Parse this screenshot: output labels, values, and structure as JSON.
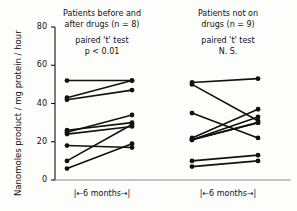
{
  "figure": {
    "background_color": "#fdfdfb",
    "ink_color": "#111111"
  },
  "axis": {
    "y_title": "Nanomoles product / mg protein / hour",
    "y_ticks": [
      "0",
      "20",
      "40",
      "60",
      "80"
    ],
    "y_tick_values": [
      0,
      20,
      40,
      60,
      80
    ],
    "y_min": 0,
    "y_max": 80
  },
  "groups": {
    "left": {
      "heading": "Patients before and\nafter drugs (n = 8)",
      "stat_line1": "paired 't' test",
      "stat_line2": "p  <  0.01",
      "span_label": "|←6 months→|"
    },
    "right": {
      "heading": "Patients not on\ndrugs (n = 9)",
      "stat_line1": "paired 't' test",
      "stat_line2": "N. S.",
      "span_label": "|←6 months→|"
    }
  },
  "chart_data": {
    "type": "line",
    "title": "",
    "xlabel": "",
    "ylabel": "Nanomoles product / mg protein / hour",
    "ylim": [
      0,
      80
    ],
    "yticks": [
      0,
      20,
      40,
      60,
      80
    ],
    "grid": false,
    "legend": "none",
    "x_categories": [
      "before",
      "after"
    ],
    "annotations": [
      "Patients before and after drugs (n = 8)",
      "paired 't' test p < 0.01",
      "Patients not on drugs (n = 9)",
      "paired 't' test N. S.",
      "|<-6 months->|"
    ],
    "series": [
      {
        "name": "left-1",
        "group": "left",
        "values": [
          52,
          52
        ]
      },
      {
        "name": "left-2",
        "group": "left",
        "values": [
          43,
          52
        ]
      },
      {
        "name": "left-3",
        "group": "left",
        "values": [
          42,
          47
        ]
      },
      {
        "name": "left-4",
        "group": "left",
        "values": [
          26,
          30
        ]
      },
      {
        "name": "left-5",
        "group": "left",
        "values": [
          25,
          34
        ]
      },
      {
        "name": "left-6",
        "group": "left",
        "values": [
          24,
          28
        ]
      },
      {
        "name": "left-7",
        "group": "left",
        "values": [
          18,
          17
        ]
      },
      {
        "name": "left-8",
        "group": "left",
        "values": [
          10,
          29
        ]
      },
      {
        "name": "left-9",
        "group": "left",
        "values": [
          6,
          19
        ]
      },
      {
        "name": "right-1",
        "group": "right",
        "values": [
          51,
          53
        ]
      },
      {
        "name": "right-2",
        "group": "right",
        "values": [
          50,
          31
        ]
      },
      {
        "name": "right-3",
        "group": "right",
        "values": [
          35,
          22
        ]
      },
      {
        "name": "right-4",
        "group": "right",
        "values": [
          22,
          37
        ]
      },
      {
        "name": "right-5",
        "group": "right",
        "values": [
          21,
          33
        ]
      },
      {
        "name": "right-6",
        "group": "right",
        "values": [
          21,
          30
        ]
      },
      {
        "name": "right-7",
        "group": "right",
        "values": [
          21,
          30
        ]
      },
      {
        "name": "right-8",
        "group": "right",
        "values": [
          10,
          13
        ]
      },
      {
        "name": "right-9",
        "group": "right",
        "values": [
          7,
          10
        ]
      }
    ]
  }
}
